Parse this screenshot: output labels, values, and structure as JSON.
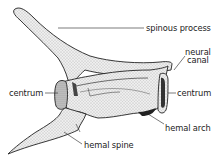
{
  "diagram": {
    "labels": {
      "spinous_process": "spinous process",
      "neural_canal_line1": "neural",
      "neural_canal_line2": "canal",
      "centrum_left": "centrum",
      "centrum_right": "centrum",
      "hemal_arch": "hemal arch",
      "hemal_spine": "hemal spine"
    },
    "colors": {
      "ink": "#222222",
      "bone_fill": "#e9e9e9",
      "background": "#ffffff"
    }
  }
}
